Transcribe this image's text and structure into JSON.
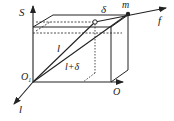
{
  "diagram": {
    "type": "3d-box-geometry",
    "colors": {
      "line": "#222222",
      "background": "#ffffff"
    },
    "labels": {
      "s_axis": "S",
      "f_axis": "f",
      "l_axis": "l",
      "o_axis": "O",
      "origin": "O",
      "origin_sub": "1",
      "point_m": "m",
      "delta": "δ",
      "segment_l": "l",
      "segment_l_delta": "l+δ"
    }
  }
}
